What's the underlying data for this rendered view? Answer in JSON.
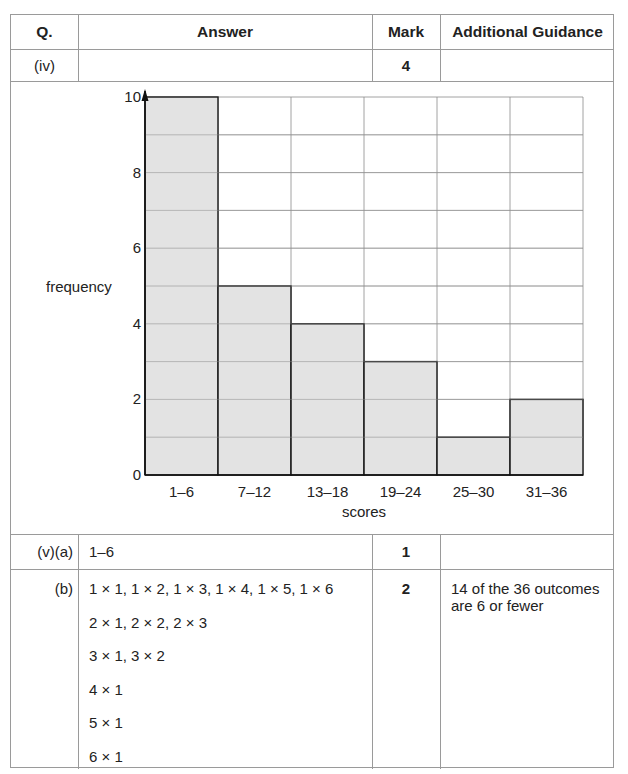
{
  "table": {
    "headers": {
      "q": "Q.",
      "answer": "Answer",
      "mark": "Mark",
      "guidance": "Additional Guidance"
    },
    "rows": [
      {
        "q": "(iv)",
        "answer": "",
        "mark": "4",
        "guidance": ""
      },
      {
        "q": "(v)(a)",
        "answer": "1–6",
        "mark": "1",
        "guidance": ""
      },
      {
        "q": "(b)",
        "answer_lines": [
          "1 × 1, 1 × 2, 1 × 3, 1 × 4, 1 × 5, 1 × 6",
          "2 × 1, 2 × 2, 2 × 3",
          "3 × 1, 3 × 2",
          "4 × 1",
          "5 × 1",
          "6 × 1"
        ],
        "mark": "2",
        "guidance": "14 of the 36 outcomes are 6 or fewer"
      }
    ]
  },
  "chart_data": {
    "type": "bar",
    "title": "",
    "xlabel": "scores",
    "ylabel": "frequency",
    "categories": [
      "1–6",
      "7–12",
      "13–18",
      "19–24",
      "25–30",
      "31–36"
    ],
    "values": [
      10,
      5,
      4,
      3,
      1,
      2
    ],
    "ylim": [
      0,
      10
    ],
    "yticks": [
      0,
      2,
      4,
      6,
      8,
      10
    ],
    "grid": true,
    "minor_grid_step": 1,
    "bar_color": "#d9d9d9",
    "legend": null
  }
}
